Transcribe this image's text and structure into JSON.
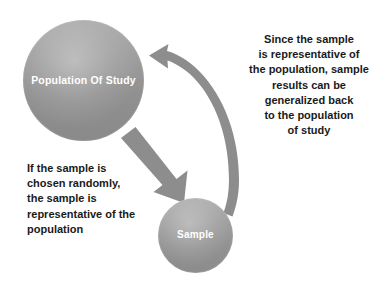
{
  "diagram": {
    "background_color": "#ffffff",
    "nodes": [
      {
        "id": "population",
        "label": "Population\nOf Study",
        "shape": "circle",
        "fill_color": "#9a9a9a",
        "text_color": "#ffffff"
      },
      {
        "id": "sample",
        "label": "Sample",
        "shape": "circle",
        "fill_color": "#9a9a9a",
        "text_color": "#ffffff"
      }
    ],
    "annotations": [
      {
        "id": "note-left",
        "text": "If the sample is\nchosen randomly,\nthe sample is\nrepresentative of the\npopulation",
        "align": "left",
        "text_color": "#1a1a1a"
      },
      {
        "id": "note-right",
        "text": "Since the sample\nis representative of\nthe population, sample\nresults can be\ngeneralized back\nto the population\nof study",
        "align": "center",
        "text_color": "#1a1a1a"
      }
    ],
    "arrows": [
      {
        "id": "arrow-population-to-sample",
        "type": "straight",
        "from": "population",
        "to": "sample",
        "direction": "down-right",
        "color": "#8d8d8d"
      },
      {
        "id": "arrow-sample-to-population",
        "type": "curved",
        "from": "sample",
        "to": "population",
        "direction": "counter-clockwise",
        "color": "#8d8d8d"
      }
    ]
  }
}
